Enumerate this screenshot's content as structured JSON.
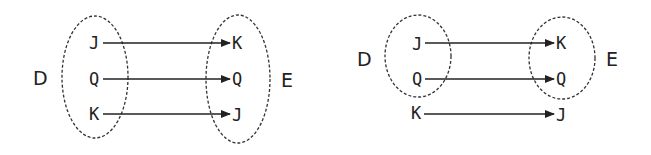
{
  "diagrams": [
    {
      "domain_label": "D",
      "codomain_label": "E",
      "domain": [
        "J",
        "Q",
        "K"
      ],
      "codomain": [
        "K",
        "Q",
        "J"
      ],
      "mappings": [
        [
          "J",
          "K"
        ],
        [
          "Q",
          "Q"
        ],
        [
          "K",
          "J"
        ]
      ]
    },
    {
      "domain_label": "D",
      "codomain_label": "E",
      "domain": [
        "J",
        "Q"
      ],
      "codomain": [
        "K",
        "Q"
      ],
      "outside_left": "K",
      "outside_right": "J",
      "mappings": [
        [
          "J",
          "K"
        ],
        [
          "Q",
          "Q"
        ],
        [
          "K",
          "J"
        ]
      ]
    }
  ]
}
